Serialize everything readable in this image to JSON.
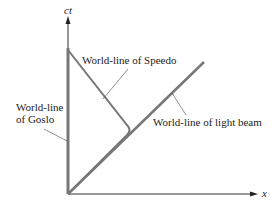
{
  "diagram": {
    "type": "spacetime-diagram",
    "axes": {
      "vertical_label": "ct",
      "horizontal_label": "x"
    },
    "labels": {
      "speedo": "World-line of Speedo",
      "goslo_line1": "World-line",
      "goslo_line2": "of Goslo",
      "light": "World-line of light beam"
    },
    "colors": {
      "worldline": "#777777",
      "axis": "#333333",
      "leader": "#444444"
    }
  }
}
